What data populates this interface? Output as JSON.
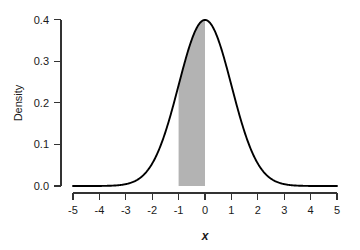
{
  "chart_data": {
    "type": "line",
    "title": "",
    "subtitle": "",
    "xlabel": "x",
    "ylabel": "Density",
    "xlim": [
      -5,
      5
    ],
    "ylim": [
      0.0,
      0.4
    ],
    "grid": false,
    "legend": null,
    "distribution": "standard normal",
    "mean": 0,
    "sd": 1,
    "x_ticks": [
      -5,
      -4,
      -3,
      -2,
      -1,
      0,
      1,
      2,
      3,
      4,
      5
    ],
    "x_tick_labels": [
      "-5",
      "-4",
      "-3",
      "-2",
      "-1",
      "0",
      "1",
      "2",
      "3",
      "4",
      "5"
    ],
    "y_ticks": [
      0.0,
      0.1,
      0.2,
      0.3,
      0.4
    ],
    "y_tick_labels": [
      "0.0",
      "0.1",
      "0.2",
      "0.3",
      "0.4"
    ],
    "series": [
      {
        "name": "Density",
        "color": "#000000",
        "x": [
          -5.0,
          -4.75,
          -4.5,
          -4.25,
          -4.0,
          -3.75,
          -3.5,
          -3.25,
          -3.0,
          -2.75,
          -2.5,
          -2.25,
          -2.0,
          -1.75,
          -1.5,
          -1.25,
          -1.0,
          -0.75,
          -0.5,
          -0.25,
          0.0,
          0.25,
          0.5,
          0.75,
          1.0,
          1.25,
          1.5,
          1.75,
          2.0,
          2.25,
          2.5,
          2.75,
          3.0,
          3.25,
          3.5,
          3.75,
          4.0,
          4.25,
          4.5,
          4.75,
          5.0
        ],
        "values": [
          1.5e-06,
          5e-06,
          1.6e-05,
          4.65e-05,
          0.0001338,
          0.0003461,
          0.0008727,
          0.0020374,
          0.0044318,
          0.0090936,
          0.0175283,
          0.031658,
          0.053991,
          0.0862773,
          0.1295176,
          0.1826491,
          0.2419707,
          0.3011374,
          0.3520653,
          0.3866681,
          0.3989423,
          0.3866681,
          0.3520653,
          0.3011374,
          0.2419707,
          0.1826491,
          0.1295176,
          0.0862773,
          0.053991,
          0.031658,
          0.0175283,
          0.0090936,
          0.0044318,
          0.0020374,
          0.0008727,
          0.0003461,
          0.0001338,
          4.65e-05,
          1.6e-05,
          5e-06,
          1.5e-06
        ]
      }
    ],
    "shaded_region": {
      "label": "shaded-area",
      "from": -1,
      "to": 0,
      "color": "#b3b3b3",
      "area": 0.3413
    },
    "peak": {
      "x": 0,
      "y": 0.3989
    }
  },
  "axes": {
    "x_title": "x",
    "y_title": "Density"
  },
  "colors": {
    "curve": "#000000",
    "shade": "#b3b3b3",
    "axis": "#333333",
    "background": "#ffffff"
  }
}
